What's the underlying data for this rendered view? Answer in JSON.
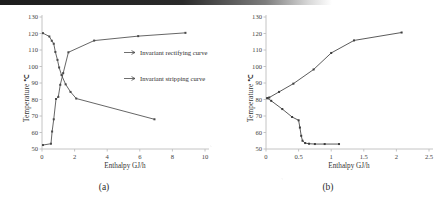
{
  "figure": {
    "panels": [
      {
        "caption": "(a)",
        "legend": [
          {
            "label": "Invariant rectifying curve",
            "marker": "line-with-arrow"
          },
          {
            "label": "Invariant stripping curve",
            "marker": "line-with-arrow"
          }
        ]
      },
      {
        "caption": "(b)",
        "legend": []
      }
    ]
  },
  "chart_data": [
    {
      "type": "line",
      "title": "",
      "panel": "(a)",
      "xlabel": "Enthalpy   GJ/h",
      "ylabel": "Temperature  ℃",
      "xlim": [
        0,
        10
      ],
      "ylim": [
        50,
        130
      ],
      "xticks": [
        0,
        2,
        4,
        6,
        8,
        10
      ],
      "xtick_labels": [
        "0",
        "2",
        "4",
        "6",
        "8",
        "10"
      ],
      "yticks": [
        50,
        60,
        70,
        80,
        90,
        100,
        110,
        120,
        130
      ],
      "ytick_labels": [
        "50",
        "60",
        "70",
        "80",
        "90",
        "100",
        "110",
        "120",
        "130"
      ],
      "grid": false,
      "legend_position": "center-right",
      "series": [
        {
          "name": "Invariant rectifying curve",
          "color": "#4a4a4a",
          "x": [
            0.06,
            0.55,
            0.62,
            0.72,
            0.86,
            1.0,
            1.12,
            1.3,
            1.62,
            3.2,
            5.9,
            8.8
          ],
          "y": [
            52.4,
            53.2,
            60.6,
            68.0,
            80.3,
            81.6,
            88.9,
            96.0,
            108.6,
            115.7,
            118.4,
            120.4
          ]
        },
        {
          "name": "Invariant stripping curve",
          "color": "#4a4a4a",
          "x": [
            0.06,
            0.45,
            0.6,
            0.72,
            0.82,
            0.95,
            1.05,
            1.2,
            1.45,
            1.75,
            2.1,
            6.9
          ],
          "y": [
            120.2,
            118.2,
            115.6,
            113.8,
            108.8,
            104.0,
            99.4,
            94.8,
            89.2,
            84.6,
            80.6,
            68.0
          ]
        }
      ]
    },
    {
      "type": "line",
      "title": "",
      "panel": "(b)",
      "xlabel": "Enthalpy   GJ/h",
      "ylabel": "Temperature  ℃",
      "xlim": [
        0,
        2.5
      ],
      "ylim": [
        50,
        130
      ],
      "xticks": [
        0,
        0.5,
        1,
        1.5,
        2,
        2.5
      ],
      "xtick_labels": [
        "0",
        "0.5",
        "1",
        "1.5",
        "2",
        "2.5"
      ],
      "yticks": [
        50,
        60,
        70,
        80,
        90,
        100,
        110,
        120,
        130
      ],
      "ytick_labels": [
        "50",
        "60",
        "70",
        "80",
        "90",
        "100",
        "110",
        "120",
        "130"
      ],
      "grid": false,
      "legend_position": "none",
      "series": [
        {
          "name": "Invariant rectifying curve",
          "color": "#3d3d3d",
          "x": [
            0.02,
            0.05,
            0.2,
            0.42,
            0.73,
            1.0,
            1.35,
            2.08
          ],
          "y": [
            80.8,
            81.2,
            84.6,
            89.6,
            98.2,
            108.2,
            115.8,
            120.6
          ]
        },
        {
          "name": "Invariant stripping curve",
          "color": "#3d3d3d",
          "x": [
            0.02,
            0.08,
            0.25,
            0.4,
            0.5,
            0.52,
            0.54,
            0.56,
            0.6,
            0.66,
            0.75,
            0.9,
            1.12
          ],
          "y": [
            80.8,
            79.2,
            74.2,
            69.4,
            67.4,
            63.0,
            58.0,
            55.0,
            53.6,
            53.2,
            53.0,
            53.0,
            53.0
          ]
        }
      ]
    }
  ]
}
